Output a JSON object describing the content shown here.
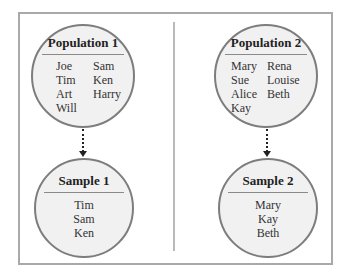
{
  "left": {
    "population": {
      "title": "Population 1",
      "col1": [
        "Joe",
        "Tim",
        "Art",
        "Will"
      ],
      "col2": [
        "Sam",
        "Ken",
        "Harry"
      ]
    },
    "sample": {
      "title": "Sample 1",
      "members": [
        "Tim",
        "Sam",
        "Ken"
      ]
    }
  },
  "right": {
    "population": {
      "title": "Population 2",
      "col1": [
        "Mary",
        "Sue",
        "Alice",
        "Kay"
      ],
      "col2": [
        "Rena",
        "Louise",
        "Beth"
      ]
    },
    "sample": {
      "title": "Sample 2",
      "members": [
        "Mary",
        "Kay",
        "Beth"
      ]
    }
  }
}
